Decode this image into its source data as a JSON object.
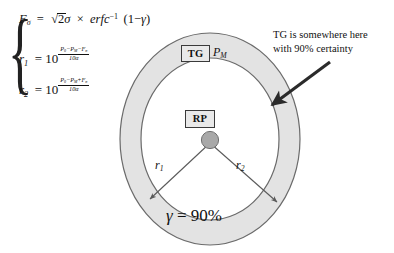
{
  "figure": {
    "colors": {
      "annulus_fill": "#e3e3e3",
      "annulus_stroke": "#6b6b6b",
      "inner_fill": "#ffffff",
      "node_fill": "#a8a8a8",
      "node_stroke": "#6b6b6b",
      "box_fill": "#e9e9e9",
      "box_stroke": "#3a3a3a",
      "arrow_color": "#2b2b2b",
      "text_color": "#111111"
    }
  },
  "equations": {
    "brace": "{",
    "line1": {
      "lhs": "F",
      "lhs_sub": "σ",
      "eq": "=",
      "rhs_pre": "2",
      "sigma": "σ",
      "times": "×",
      "func": "erfc",
      "func_sup": "-1",
      "arg": "(1 − γ)",
      "full": "Fσ = √2σ × erfc⁻¹(1 − γ)"
    },
    "line2": {
      "lhs": "r",
      "lhs_sub": "1",
      "eq": "=",
      "base": "10",
      "numerator": "P₀ − Pₘ − Fσ",
      "denominator": "10α",
      "full": "r₁ = 10^((P₀ − Pₘ − Fσ)/(10α))"
    },
    "line3": {
      "lhs": "r",
      "lhs_sub": "2",
      "eq": "=",
      "base": "10",
      "numerator": "P₀ − Pₘ + Fσ",
      "denominator": "10α",
      "full": "r₂ = 10^((P₀ − Pₘ + Fσ)/(10α))"
    }
  },
  "diagram": {
    "tg_box_label": "TG",
    "pm_label_base": "P",
    "pm_label_sub": "M",
    "rp_box_label": "RP",
    "r1_label_base": "r",
    "r1_label_sub": "1",
    "r2_label_base": "r",
    "r2_label_sub": "2",
    "gamma_symbol": "γ",
    "gamma_equals": " = ",
    "gamma_value": "90%",
    "center_node": "reference-point-node"
  },
  "annotation": {
    "line1": "TG is somewhere here",
    "line2": "with 90% certainty",
    "arrow": "arrow pointing to annulus"
  },
  "geometry": {
    "center_x": 210,
    "center_y": 139,
    "outer_rx": 90,
    "outer_ry": 106,
    "inner_rx": 69,
    "inner_ry": 81
  }
}
